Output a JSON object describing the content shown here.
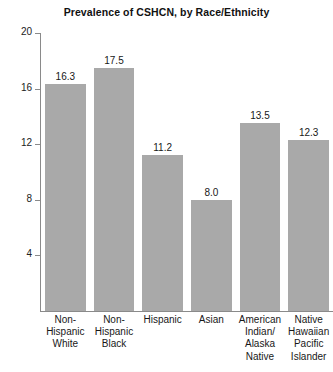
{
  "chart_data": {
    "type": "bar",
    "title": "Prevalence of CSHCN, by Race/Ethnicity",
    "xlabel": "",
    "ylabel": "",
    "ylim": [
      0,
      20
    ],
    "yticks": [
      4,
      8,
      12,
      16,
      20
    ],
    "grid": false,
    "legend": "none",
    "bar_color": "#a9a9a9",
    "categories": [
      "Non-Hispanic White",
      "Non-Hispanic Black",
      "Hispanic",
      "Asian",
      "American Indian/ Alaska Native",
      "Native Hawaiian Pacific Islander"
    ],
    "category_lines": [
      [
        "Non-",
        "Hispanic",
        "White"
      ],
      [
        "Non-",
        "Hispanic",
        "Black"
      ],
      [
        "Hispanic"
      ],
      [
        "Asian"
      ],
      [
        "American",
        "Indian/",
        "Alaska",
        "Native"
      ],
      [
        "Native",
        "Hawaiian",
        "Pacific",
        "Islander"
      ]
    ],
    "values": [
      16.3,
      17.5,
      11.2,
      8.0,
      13.5,
      12.3
    ],
    "value_labels": [
      "16.3",
      "17.5",
      "11.2",
      "8.0",
      "13.5",
      "12.3"
    ],
    "ytick_labels": [
      "4",
      "8",
      "12",
      "16",
      "20"
    ]
  }
}
